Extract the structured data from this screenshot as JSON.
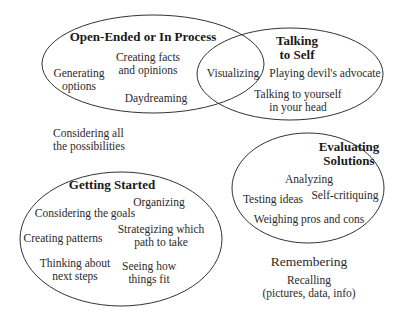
{
  "diagram": {
    "type": "venn-style ellipse diagram",
    "stroke_color": "#333333",
    "groups": {
      "open_ended": {
        "title": "Open-Ended or In Process",
        "items": [
          "Generating",
          "options",
          "Creating facts",
          "and opinions",
          "Daydreaming"
        ]
      },
      "talking_to_self": {
        "title_line1": "Talking",
        "title_line2": "to Self",
        "items": [
          "Playing devil's advocate",
          "Talking to yourself",
          "in your head"
        ]
      },
      "overlap": {
        "item": "Visualizing"
      },
      "evaluating": {
        "title_line1": "Evaluating",
        "title_line2": "Solutions",
        "items": [
          "Analyzing",
          "Testing ideas",
          "Self-critiquing",
          "Weighing pros and cons"
        ]
      },
      "getting_started": {
        "title": "Getting Started",
        "items": [
          "Organizing",
          "Considering the goals",
          "Creating patterns",
          "Strategizing which",
          "path to take",
          "Thinking about",
          "next steps",
          "Seeing how",
          "things fit"
        ]
      },
      "standalone": {
        "considering_line1": "Considering all",
        "considering_line2": "the possibilities",
        "remembering": "Remembering",
        "recalling_line1": "Recalling",
        "recalling_line2": "(pictures, data, info)"
      }
    }
  }
}
